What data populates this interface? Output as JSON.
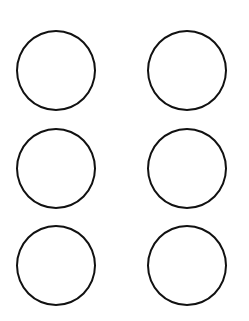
{
  "diagram": {
    "layout": "grid",
    "rows": 3,
    "columns": 2,
    "shape": "circle",
    "stroke_color": "#111111",
    "fill_color": "#ffffff",
    "background_color": "#ffffff",
    "circles": [
      {
        "row": 1,
        "col": 1,
        "label": ""
      },
      {
        "row": 1,
        "col": 2,
        "label": ""
      },
      {
        "row": 2,
        "col": 1,
        "label": ""
      },
      {
        "row": 2,
        "col": 2,
        "label": ""
      },
      {
        "row": 3,
        "col": 1,
        "label": ""
      },
      {
        "row": 3,
        "col": 2,
        "label": ""
      }
    ]
  }
}
